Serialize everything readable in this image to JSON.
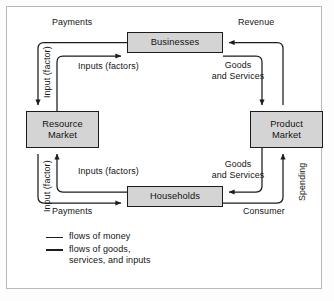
{
  "diagram": {
    "boxes": {
      "businesses": "Businesses",
      "households": "Households",
      "resource_market_line1": "Resource",
      "resource_market_line2": "Market",
      "product_market_line1": "Product",
      "product_market_line2": "Market"
    },
    "labels": {
      "payments_top": "Payments",
      "payments_bottom": "Payments",
      "input_factor_upper": "Input (factor)",
      "input_factor_lower": "Input (factor)",
      "inputs_factors_upper": "Inputs (factors)",
      "inputs_factors_lower": "Inputs (factors)",
      "revenue": "Revenue",
      "goods_and_services_upper": "Goods\nand Services",
      "goods_and_services_lower": "Goods\nand Services",
      "consumer": "Consumer",
      "spending": "Spending"
    },
    "legend": [
      {
        "marker": "line",
        "text": "flows of money"
      },
      {
        "marker": "line",
        "text": "flows of goods,\nservices, and inputs"
      }
    ],
    "colors": {
      "box_fill": "#d4d4d4",
      "stroke": "#1c1c1c",
      "frame_border": "#b9b9bd",
      "background": "#ffffff",
      "text": "#141414"
    }
  }
}
